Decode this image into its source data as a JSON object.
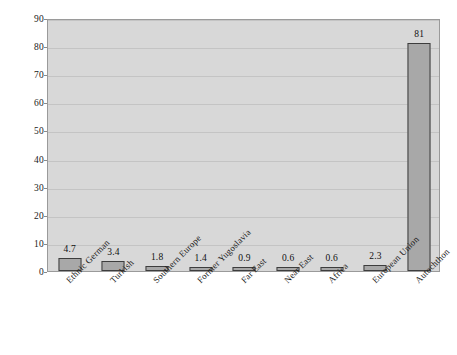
{
  "chart_data": {
    "type": "bar",
    "title": "",
    "subtitle": "",
    "xlabel": "",
    "ylabel": "",
    "ylim": [
      0,
      90
    ],
    "y_ticks": [
      0,
      10,
      20,
      30,
      40,
      50,
      60,
      70,
      80,
      90
    ],
    "y_tick_labels": [
      "0",
      "10",
      "20",
      "30",
      "40",
      "50",
      "60",
      "70",
      "80",
      "90"
    ],
    "grid": true,
    "legend": false,
    "legend_position": "none",
    "categories": [
      "Ethnic German",
      "Turkish",
      "Southern Europe",
      "Former Yugoslavia",
      "Far East",
      "Near East",
      "Africa",
      "European Union",
      "Autochthon"
    ],
    "values": [
      4.7,
      3.4,
      1.8,
      1.4,
      0.9,
      0.6,
      0.6,
      2.3,
      81
    ],
    "data_labels": [
      "4.7",
      "3.4",
      "1.8",
      "1.4",
      "0.9",
      "0.6",
      "0.6",
      "2.3",
      "81"
    ],
    "colors": {
      "bar_fill": "#a8a8a8",
      "bar_border": "#3d3d3d",
      "plot_background": "#d8d8d8",
      "gridline": "#c4c4c4",
      "axis_border": "#9a9a9a",
      "text": "#1a1a1a",
      "page_background": "#ffffff"
    }
  }
}
